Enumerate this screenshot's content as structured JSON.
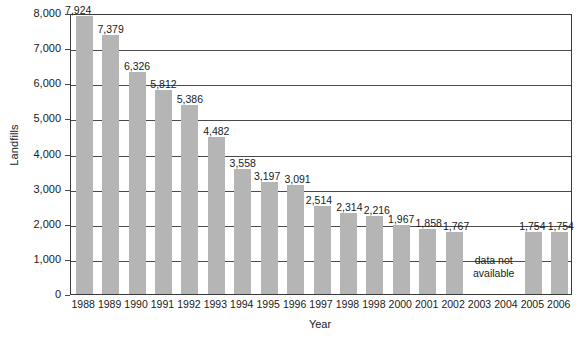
{
  "chart_data": {
    "type": "bar",
    "title": "",
    "xlabel": "Year",
    "ylabel": "Landfills",
    "ylim": [
      0,
      8000
    ],
    "ytick_values": [
      0,
      1000,
      2000,
      3000,
      4000,
      5000,
      6000,
      7000,
      8000
    ],
    "ytick_labels": [
      "0",
      "1,000",
      "2,000",
      "3,000",
      "4,000",
      "5,000",
      "6,000",
      "7,000",
      "8,000"
    ],
    "grid": true,
    "legend": "none",
    "bar_color": "#b5b5b5",
    "axis_color": "#3a3a3a",
    "categories": [
      "1988",
      "1989",
      "1990",
      "1991",
      "1992",
      "1993",
      "1994",
      "1995",
      "1996",
      "1997",
      "1998",
      "1998",
      "2000",
      "2001",
      "2002",
      "2003",
      "2004",
      "2005",
      "2006"
    ],
    "values": [
      7924,
      7379,
      6326,
      5812,
      5386,
      4482,
      3558,
      3197,
      3091,
      2514,
      2314,
      2216,
      1967,
      1858,
      1767,
      null,
      null,
      1754,
      1754
    ],
    "value_labels": [
      "7,924",
      "7,379",
      "6,326",
      "5,812",
      "5,386",
      "4,482",
      "3,558",
      "3,197",
      "3,091",
      "2,514",
      "2,314",
      "2,216",
      "1,967",
      "1,858",
      "1,767",
      "",
      "",
      "1,754",
      "1,754"
    ],
    "annotations": [
      {
        "name": "data-not-available-note",
        "text_line1": "data not",
        "text_line2": "available",
        "covers_categories": [
          "2003",
          "2004"
        ]
      }
    ]
  }
}
